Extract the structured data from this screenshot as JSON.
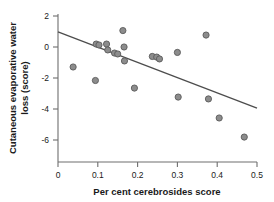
{
  "chart_data": {
    "type": "scatter",
    "title": "",
    "xlabel": "Per cent cerebrosides score",
    "ylabel": "Cutaneous evaporative water loss (score)",
    "ylabel_line1": "Cutaneous evaporative water",
    "ylabel_line2": "loss (score)",
    "xlim": [
      0,
      0.5
    ],
    "ylim": [
      -7.4,
      2.0
    ],
    "xticks": [
      0,
      0.1,
      0.2,
      0.3,
      0.4,
      0.5
    ],
    "xtick_labels": [
      "0",
      "0.1",
      "0.2",
      "0.3",
      "0.4",
      "0.5"
    ],
    "yticks": [
      2,
      0,
      -2,
      -4,
      -6
    ],
    "ytick_labels": [
      "2",
      "0",
      "-2",
      "-4",
      "-6"
    ],
    "grid": false,
    "legend": "none",
    "marker": {
      "shape": "circle",
      "fill_color": "#8c8c8c",
      "edge_color": "#5a5a5a",
      "radius": 3.1
    },
    "points": [
      {
        "x": 0.038,
        "y": -1.29
      },
      {
        "x": 0.094,
        "y": -2.16
      },
      {
        "x": 0.096,
        "y": 0.19
      },
      {
        "x": 0.103,
        "y": 0.13
      },
      {
        "x": 0.122,
        "y": 0.19
      },
      {
        "x": 0.125,
        "y": -0.19
      },
      {
        "x": 0.142,
        "y": -0.39
      },
      {
        "x": 0.15,
        "y": -0.45
      },
      {
        "x": 0.163,
        "y": 1.06
      },
      {
        "x": 0.166,
        "y": 0.0
      },
      {
        "x": 0.167,
        "y": -0.9
      },
      {
        "x": 0.192,
        "y": -2.65
      },
      {
        "x": 0.237,
        "y": -0.61
      },
      {
        "x": 0.248,
        "y": -0.65
      },
      {
        "x": 0.255,
        "y": -0.77
      },
      {
        "x": 0.3,
        "y": -0.35
      },
      {
        "x": 0.302,
        "y": -3.23
      },
      {
        "x": 0.372,
        "y": 0.77
      },
      {
        "x": 0.378,
        "y": -3.35
      },
      {
        "x": 0.405,
        "y": -4.58
      },
      {
        "x": 0.468,
        "y": -5.81
      }
    ],
    "trend_line": {
      "type": "linear-regression",
      "color": "#4d4d4d",
      "x_start": 0.0,
      "y_start": 0.97,
      "x_end": 0.5,
      "y_end": -3.94
    },
    "axis_color": "#6e6e6e",
    "frame": {
      "left": true,
      "bottom": true,
      "top": false,
      "right": false
    }
  }
}
